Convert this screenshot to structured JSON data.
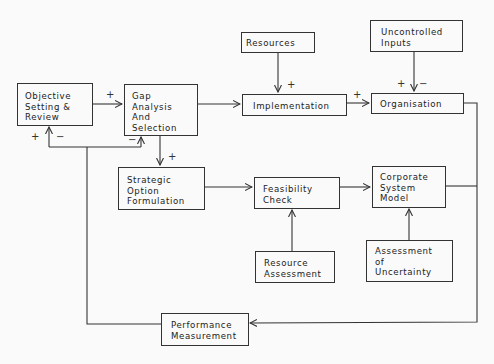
{
  "diagram": {
    "type": "flowchart",
    "nodes": [
      {
        "id": "objective",
        "label": "Objective\nSetting &\nReview"
      },
      {
        "id": "gap",
        "label": "Gap\nAnalysis\nAnd\nSelection"
      },
      {
        "id": "resources",
        "label": "Resources"
      },
      {
        "id": "uncontrolled",
        "label": "Uncontrolled\nInputs"
      },
      {
        "id": "implementation",
        "label": "Implementation"
      },
      {
        "id": "organisation",
        "label": "Organisation"
      },
      {
        "id": "strategic",
        "label": "Strategic\nOption\nFormulation"
      },
      {
        "id": "feasibility",
        "label": "Feasibility\nCheck"
      },
      {
        "id": "corporate",
        "label": "Corporate\nSystem\nModel"
      },
      {
        "id": "resource_assessment",
        "label": "Resource\nAssessment"
      },
      {
        "id": "uncertainty",
        "label": "Assessment\nof\nUncertainty"
      },
      {
        "id": "performance",
        "label": "Performance\nMeasurement"
      }
    ],
    "edges": [
      {
        "from": "objective",
        "to": "gap",
        "sign": "+"
      },
      {
        "from": "gap",
        "to": "implementation",
        "sign": ""
      },
      {
        "from": "resources",
        "to": "implementation",
        "sign": "+"
      },
      {
        "from": "implementation",
        "to": "organisation",
        "sign": "+"
      },
      {
        "from": "uncontrolled",
        "to": "organisation",
        "sign": "+ −"
      },
      {
        "from": "gap",
        "to": "strategic",
        "sign": "+"
      },
      {
        "from": "strategic",
        "to": "feasibility",
        "sign": ""
      },
      {
        "from": "resource_assessment",
        "to": "feasibility",
        "sign": ""
      },
      {
        "from": "feasibility",
        "to": "corporate",
        "sign": ""
      },
      {
        "from": "uncertainty",
        "to": "corporate",
        "sign": ""
      },
      {
        "from": "organisation",
        "to": "performance",
        "sign": ""
      },
      {
        "from": "corporate",
        "to": "performance",
        "sign": ""
      },
      {
        "from": "performance",
        "to": "objective",
        "sign": "+ −"
      },
      {
        "from": "performance",
        "to": "gap",
        "sign": "−"
      }
    ],
    "signs": {
      "obj_to_gap": "+",
      "res_to_impl": "+",
      "impl_to_org": "+",
      "unc_plus": "+",
      "unc_minus": "−",
      "gap_to_strat": "+",
      "fb_obj_plus": "+",
      "fb_obj_minus": "−",
      "fb_gap_minus": "−"
    }
  }
}
